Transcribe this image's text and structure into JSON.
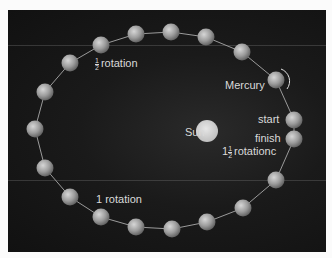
{
  "diagram": {
    "colors": {
      "background": "#fbfbfb",
      "panel": "#161616",
      "planet": "#a8a8a8",
      "orbit_line": "#9a9a9a",
      "sun": "#d8d8d8",
      "text": "#d9d9d9"
    },
    "sun": {
      "label": "Sun",
      "cx": 207,
      "cy": 131,
      "r": 11
    },
    "planet_name": "Mercury",
    "labels": {
      "half_rotation": {
        "whole": "",
        "num": "1",
        "den": "2",
        "text": "rotation"
      },
      "one_rotation": "1 rotation",
      "mercury": "Mercury",
      "start": "start",
      "finish": "finish",
      "one_half_rotations": {
        "whole": "1",
        "num": "1",
        "den": "2",
        "text": "rotationc"
      }
    },
    "planets": [
      {
        "cx": 294,
        "cy": 120,
        "tag": "start"
      },
      {
        "cx": 276,
        "cy": 80,
        "tag": "mercury"
      },
      {
        "cx": 242,
        "cy": 52
      },
      {
        "cx": 206,
        "cy": 37
      },
      {
        "cx": 171,
        "cy": 32
      },
      {
        "cx": 136,
        "cy": 34
      },
      {
        "cx": 101,
        "cy": 45,
        "tag": "half_rotation"
      },
      {
        "cx": 70,
        "cy": 63
      },
      {
        "cx": 45,
        "cy": 92
      },
      {
        "cx": 35,
        "cy": 129
      },
      {
        "cx": 45,
        "cy": 168
      },
      {
        "cx": 70,
        "cy": 197
      },
      {
        "cx": 101,
        "cy": 217,
        "tag": "one_rotation"
      },
      {
        "cx": 136,
        "cy": 227
      },
      {
        "cx": 172,
        "cy": 229
      },
      {
        "cx": 207,
        "cy": 222
      },
      {
        "cx": 243,
        "cy": 208
      },
      {
        "cx": 276,
        "cy": 180
      },
      {
        "cx": 294,
        "cy": 139,
        "tag": "finish"
      }
    ]
  }
}
